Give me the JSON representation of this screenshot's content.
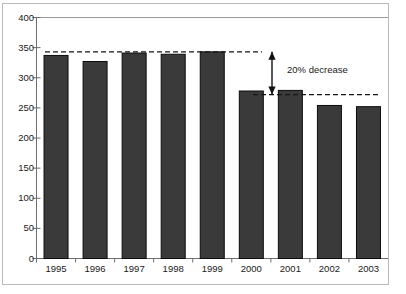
{
  "chart_data": {
    "type": "bar",
    "title": "",
    "xlabel": "",
    "ylabel": "",
    "categories": [
      "1995",
      "1996",
      "1997",
      "1998",
      "1999",
      "2000",
      "2001",
      "2002",
      "2003"
    ],
    "values": [
      337,
      327,
      341,
      339,
      343,
      278,
      279,
      254,
      252
    ],
    "ylim": [
      0,
      400
    ],
    "yticks": [
      0,
      50,
      100,
      150,
      200,
      250,
      300,
      350,
      400
    ],
    "ytick_labels": [
      "0",
      "50",
      "100",
      "150",
      "200",
      "250",
      "300",
      "350",
      "400"
    ],
    "grid": false,
    "legend": null,
    "series": [
      {
        "name": "",
        "values": [
          337,
          327,
          341,
          339,
          343,
          278,
          279,
          254,
          252
        ]
      }
    ],
    "annotations": [
      {
        "name": "decrease-label",
        "text": "20% decrease",
        "type": "arrow-span",
        "from_value": 343,
        "to_value": 272
      },
      {
        "name": "upper-reference-line",
        "type": "dashed-hline",
        "value": 343
      },
      {
        "name": "lower-reference-line",
        "type": "dashed-hline",
        "value": 272
      }
    ],
    "colors": {
      "bar_fill": "#3a3a3a",
      "bar_stroke": "#0c0c0c",
      "axis": "#6e6e6e",
      "frame": "#b9b9b9",
      "text": "#1a1a1a",
      "background": "#ffffff"
    }
  }
}
